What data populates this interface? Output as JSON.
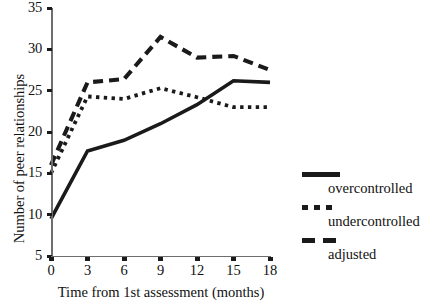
{
  "chart_data": {
    "type": "line",
    "title": "",
    "xlabel": "Time from 1st assessment (months)",
    "ylabel": "Number of peer relationships",
    "x": [
      0,
      3,
      6,
      9,
      12,
      15,
      18
    ],
    "xticklabels": [
      "0",
      "3",
      "6",
      "9",
      "12",
      "15",
      "18"
    ],
    "yticklabels": [
      "5",
      "10",
      "15",
      "20",
      "25",
      "30",
      "35"
    ],
    "yticks": [
      5,
      10,
      15,
      20,
      25,
      30,
      35
    ],
    "xlim": [
      0,
      18
    ],
    "ylim": [
      5,
      35
    ],
    "grid": false,
    "legend_position": "right",
    "series": [
      {
        "name": "overcontrolled",
        "style": "solid",
        "color": "#1a1a1a",
        "values": [
          9.5,
          17.7,
          19.0,
          21.0,
          23.3,
          26.2,
          26.0
        ]
      },
      {
        "name": "undercontrolled",
        "style": "dotted",
        "color": "#1a1a1a",
        "values": [
          15.0,
          24.3,
          24.0,
          25.3,
          24.2,
          23.0,
          23.0
        ]
      },
      {
        "name": "adjusted",
        "style": "dashed",
        "color": "#1a1a1a",
        "values": [
          16.0,
          26.0,
          26.4,
          31.5,
          29.0,
          29.2,
          27.5
        ]
      }
    ]
  },
  "legend": {
    "items": [
      {
        "label": "overcontrolled",
        "style": "solid"
      },
      {
        "label": "undercontrolled",
        "style": "dotted"
      },
      {
        "label": "adjusted",
        "style": "dashed"
      }
    ]
  }
}
